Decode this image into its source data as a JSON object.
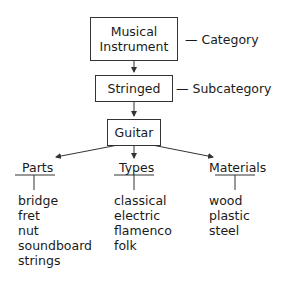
{
  "diagram": {
    "nodes": {
      "category": {
        "text_line1": "Musical",
        "text_line2": "Instrument",
        "annotation": "— Category"
      },
      "subcategory": {
        "text": "Stringed",
        "annotation": "— Subcategory"
      },
      "item": {
        "text": "Guitar"
      }
    },
    "groups": [
      {
        "heading": "Parts",
        "items": [
          "bridge",
          "fret",
          "nut",
          "soundboard",
          "strings"
        ]
      },
      {
        "heading": "Types",
        "items": [
          "classical",
          "electric",
          "flamenco",
          "folk"
        ]
      },
      {
        "heading": "Materials",
        "items": [
          "wood",
          "plastic",
          "steel"
        ]
      }
    ],
    "colors": {
      "line": "#333333",
      "text": "#1a1a1a",
      "background": "#ffffff"
    }
  }
}
